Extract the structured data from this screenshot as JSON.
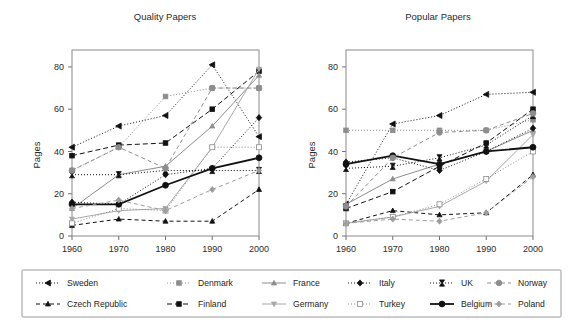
{
  "figure": {
    "width": 583,
    "height": 325,
    "background": "#ffffff"
  },
  "chart_data": {
    "type": "line",
    "title": "",
    "xlabel": "",
    "ylabel": "Pages",
    "x": [
      1960,
      1970,
      1980,
      1990,
      2000
    ],
    "xticklabels": [
      "1960",
      "1970",
      "1980",
      "1990",
      "2000"
    ],
    "yticks": [
      0,
      20,
      40,
      60,
      80
    ],
    "yticklabels": [
      "0",
      "20",
      "40",
      "60",
      "80"
    ],
    "xlim": [
      1960,
      2000
    ],
    "ylim": [
      0,
      88
    ],
    "grid": false,
    "legend_position": "bottom",
    "panels": [
      {
        "title": "Quality Papers",
        "ylabel": "Pages",
        "series": [
          {
            "name": "Sweden",
            "values": [
              42,
              52,
              57,
              81,
              47
            ]
          },
          {
            "name": "Czech Republic",
            "values": [
              5,
              8,
              7,
              7,
              22
            ]
          },
          {
            "name": "Denmark",
            "values": [
              31,
              42,
              66,
              70,
              70
            ]
          },
          {
            "name": "Finland",
            "values": [
              38,
              43,
              44,
              60,
              78
            ]
          },
          {
            "name": "France",
            "values": [
              13,
              29,
              33,
              52,
              76
            ]
          },
          {
            "name": "Germany",
            "values": [
              8,
              12,
              13,
              42,
              79
            ]
          },
          {
            "name": "Italy",
            "values": [
              16,
              15,
              29,
              32,
              56
            ]
          },
          {
            "name": "Turkey",
            "values": [
              6,
              13,
              12,
              42,
              42
            ]
          },
          {
            "name": "UK",
            "values": [
              29,
              29,
              31,
              31,
              31
            ]
          },
          {
            "name": "Belgium",
            "values": [
              15,
              15,
              24,
              32,
              37
            ]
          },
          {
            "name": "Norway",
            "values": [
              31,
              42,
              32,
              70,
              70
            ]
          },
          {
            "name": "Poland",
            "values": [
              13,
              17,
              12,
              22,
              31
            ]
          }
        ]
      },
      {
        "title": "Popular Papers",
        "ylabel": "Pages",
        "series": [
          {
            "name": "Sweden",
            "values": [
              15,
              53,
              57,
              67,
              68
            ]
          },
          {
            "name": "Czech Republic",
            "values": [
              6,
              12,
              10,
              11,
              29
            ]
          },
          {
            "name": "Denmark",
            "values": [
              50,
              50,
              50,
              50,
              55
            ]
          },
          {
            "name": "Finland",
            "values": [
              13,
              21,
              33,
              44,
              60
            ]
          },
          {
            "name": "France",
            "values": [
              15,
              27,
              34,
              40,
              50
            ]
          },
          {
            "name": "Germany",
            "values": [
              6,
              9,
              14,
              26,
              48
            ]
          },
          {
            "name": "Italy",
            "values": [
              35,
              37,
              31,
              40,
              51
            ]
          },
          {
            "name": "Turkey",
            "values": [
              6,
              9,
              15,
              27,
              40
            ]
          },
          {
            "name": "UK",
            "values": [
              32,
              33,
              37,
              43,
              57
            ]
          },
          {
            "name": "Belgium",
            "values": [
              34,
              38,
              34,
              40,
              42
            ]
          },
          {
            "name": "Norway",
            "values": [
              14,
              37,
              49,
              50,
              58
            ]
          },
          {
            "name": "Poland",
            "values": [
              6,
              8,
              7,
              11,
              28
            ]
          }
        ]
      }
    ],
    "series_style": {
      "Sweden": {
        "color": "#111111",
        "dash": "1,2",
        "marker": "triangle-left",
        "size": 5.4,
        "filled": true,
        "width": 1.0
      },
      "Czech Republic": {
        "color": "#111111",
        "dash": "4,3",
        "marker": "triangle-up",
        "size": 4.6,
        "filled": true,
        "width": 1.0
      },
      "Denmark": {
        "color": "#8d8d8d",
        "dash": "1,2",
        "marker": "square",
        "size": 4.6,
        "filled": true,
        "width": 1.0
      },
      "Finland": {
        "color": "#111111",
        "dash": "5,3",
        "marker": "square",
        "size": 4.6,
        "filled": true,
        "width": 1.0
      },
      "France": {
        "color": "#8d8d8d",
        "dash": "0",
        "marker": "triangle-up",
        "size": 4.6,
        "filled": true,
        "width": 1.0
      },
      "Germany": {
        "color": "#a8a8a8",
        "dash": "0",
        "marker": "triangle-down",
        "size": 4.6,
        "filled": true,
        "width": 1.0
      },
      "Italy": {
        "color": "#111111",
        "dash": "1,2",
        "marker": "diamond",
        "size": 5.2,
        "filled": true,
        "width": 1.0
      },
      "Turkey": {
        "color": "#8d8d8d",
        "dash": "1,2",
        "marker": "square",
        "size": 5.0,
        "filled": false,
        "width": 1.0
      },
      "UK": {
        "color": "#111111",
        "dash": "1,2",
        "marker": "bowtie",
        "size": 5.0,
        "filled": true,
        "width": 1.0
      },
      "Belgium": {
        "color": "#111111",
        "dash": "0",
        "marker": "circle",
        "size": 5.6,
        "filled": true,
        "width": 1.8
      },
      "Norway": {
        "color": "#8d8d8d",
        "dash": "4,3",
        "marker": "circle",
        "size": 5.4,
        "filled": true,
        "width": 1.0
      },
      "Poland": {
        "color": "#9d9d9d",
        "dash": "4,3",
        "marker": "diamond",
        "size": 5.0,
        "filled": true,
        "width": 1.0
      }
    }
  },
  "legend": {
    "columns": [
      [
        "Sweden",
        "Czech Republic"
      ],
      [
        "Denmark",
        "Finland"
      ],
      [
        "France",
        "Germany"
      ],
      [
        "Italy",
        "Turkey"
      ],
      [
        "UK",
        "Belgium"
      ],
      [
        "Norway",
        "Poland"
      ]
    ]
  },
  "colors": {
    "frame": "#8a8a8a",
    "text": "#2b2b2b",
    "legend_border": "#9a9a9a",
    "black_series": "#111111",
    "gray_series": "#8d8d8d"
  }
}
